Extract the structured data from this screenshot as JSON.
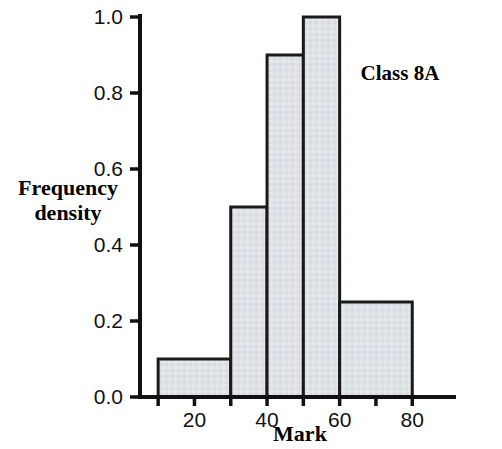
{
  "chart_data": {
    "type": "bar",
    "title": "",
    "annotation": "Class 8A",
    "xlabel": "Mark",
    "ylabel": "Frequency density",
    "ylabel_line1": "Frequency",
    "ylabel_line2": "density",
    "xlim": [
      5,
      85
    ],
    "ylim": [
      0.0,
      1.0
    ],
    "grid": false,
    "legend": "none",
    "x_ticks": [
      20,
      40,
      60,
      80
    ],
    "x_tick_labels": [
      "20",
      "40",
      "60",
      "80"
    ],
    "x_minor_ticks": [
      10,
      30,
      50,
      70
    ],
    "y_ticks": [
      0.0,
      0.2,
      0.4,
      0.6,
      0.8,
      1.0
    ],
    "y_tick_labels": [
      "0.0",
      "0.2",
      "0.4",
      "0.6",
      "0.8",
      "1.0"
    ],
    "bins": [
      {
        "label": "10-30",
        "x0": 10,
        "x1": 30,
        "value": 0.1
      },
      {
        "label": "30-40",
        "x0": 30,
        "x1": 40,
        "value": 0.5
      },
      {
        "label": "40-50",
        "x0": 40,
        "x1": 50,
        "value": 0.9
      },
      {
        "label": "50-60",
        "x0": 50,
        "x1": 60,
        "value": 1.0
      },
      {
        "label": "60-80",
        "x0": 60,
        "x1": 80,
        "value": 0.25
      }
    ],
    "bar_fill": "#dfe2e6",
    "bar_edge": "#1a1a1a",
    "axis_color": "#111111"
  }
}
